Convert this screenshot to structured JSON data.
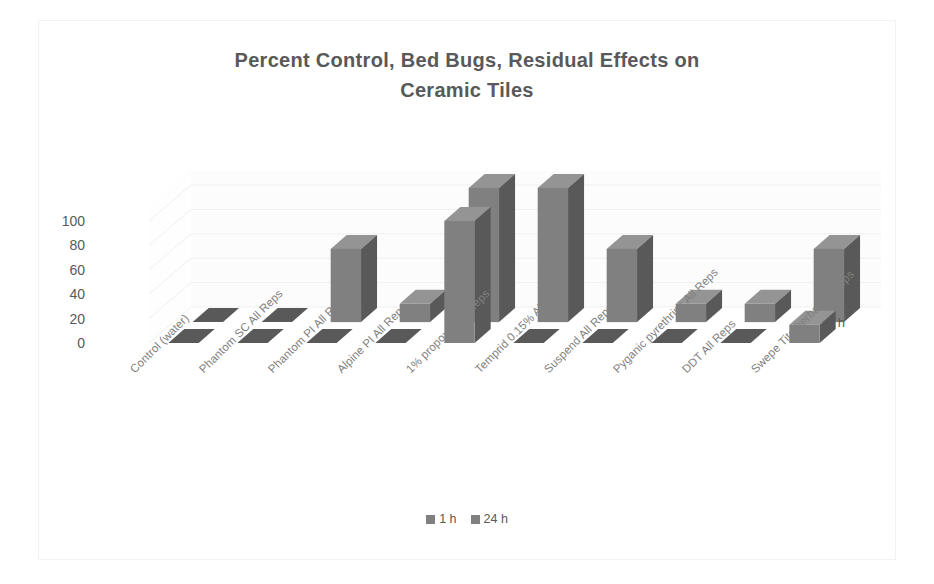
{
  "chart_data": {
    "type": "bar",
    "subtype": "3d-clustered-column",
    "title": "Percent Control, Bed Bugs, Residual Effects on Ceramic Tiles",
    "title_line1": "Percent Control,  Bed Bugs, Residual Effects on",
    "title_line2": "Ceramic Tiles",
    "xlabel": "",
    "ylabel": "",
    "zlabel": "1 h",
    "ylim": [
      0,
      100
    ],
    "yticks": [
      100,
      80,
      60,
      40,
      20,
      0
    ],
    "grid": true,
    "legend_position": "bottom",
    "categories": [
      "Control (water)",
      "Phantom SC All Reps",
      "Phantom PI All Reps",
      "Alpine PI All Reps",
      "1% propoxur All Reps",
      "Temprid 0.15% All Reps",
      "Suspend All Reps",
      "Pyganic pyrethrins All Reps",
      "DDT All Reps",
      "Swepe Tite herbal All Reps"
    ],
    "series": [
      {
        "name": "1 h",
        "color": "#808080",
        "values": [
          0,
          0,
          0,
          0,
          100,
          0,
          0,
          0,
          0,
          15
        ]
      },
      {
        "name": "24 h",
        "color": "#808080",
        "values": [
          0,
          0,
          60,
          15,
          110,
          110,
          60,
          15,
          15,
          60
        ]
      }
    ],
    "colors": {
      "bar_front": "#808080",
      "bar_side": "#595959",
      "bar_top": "#949494",
      "gridline": "#f0f0f0",
      "wall": "#fcfcfc",
      "text": "#595959",
      "category_text": "#808080",
      "border": "#f2f2f2"
    }
  },
  "legend": {
    "items": [
      {
        "label": "1 h",
        "color": "#808080"
      },
      {
        "label": "24 h",
        "color": "#808080"
      }
    ]
  }
}
